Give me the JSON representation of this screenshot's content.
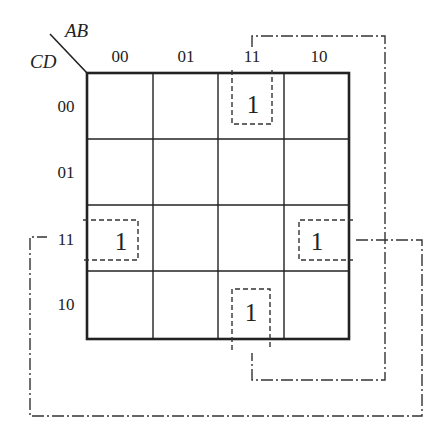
{
  "kmap": {
    "title_vars": {
      "columns": "AB",
      "rows": "CD"
    },
    "column_labels": [
      "00",
      "01",
      "11",
      "10"
    ],
    "row_labels": [
      "00",
      "01",
      "11",
      "10"
    ],
    "cells": [
      [
        "",
        "",
        "1",
        ""
      ],
      [
        "",
        "",
        "",
        ""
      ],
      [
        "1",
        "",
        "",
        "1"
      ],
      [
        "",
        "",
        "1",
        ""
      ]
    ],
    "ones": [
      {
        "row": "00",
        "col": "11",
        "value": "1"
      },
      {
        "row": "11",
        "col": "00",
        "value": "1"
      },
      {
        "row": "11",
        "col": "10",
        "value": "1"
      },
      {
        "row": "10",
        "col": "11",
        "value": "1"
      }
    ],
    "groupings": [
      {
        "name": "column-11-wrap",
        "style": "dash-dot",
        "connects": [
          "r00c11",
          "r10c11"
        ]
      },
      {
        "name": "row-11-wrap",
        "style": "dash-dot",
        "connects": [
          "r11c00",
          "r11c10"
        ]
      }
    ],
    "colors": {
      "line": "#222222",
      "background": "#ffffff"
    }
  }
}
